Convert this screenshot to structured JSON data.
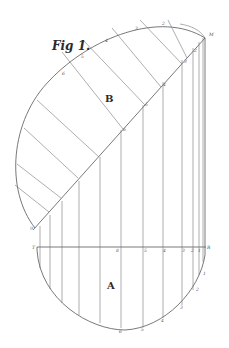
{
  "figure": {
    "title": "Fig 1.",
    "region_upper": "B",
    "region_lower": "A",
    "baseline_left_label": "T",
    "baseline_right_label": "R",
    "corner_label": "M"
  },
  "baseline_labels": [
    "8",
    "5",
    "4",
    "3",
    "2",
    "1"
  ],
  "lower_arc_labels": [
    "1",
    "2",
    "3",
    "4",
    "5",
    "6"
  ],
  "diagonal_labels": [
    "9",
    "6",
    "5",
    "4",
    "3",
    "2"
  ],
  "upper_arc_labels": [
    "6",
    "5",
    "4",
    "3",
    "2"
  ],
  "colors": {
    "ink": "#555555",
    "paper": "#ffffff"
  }
}
